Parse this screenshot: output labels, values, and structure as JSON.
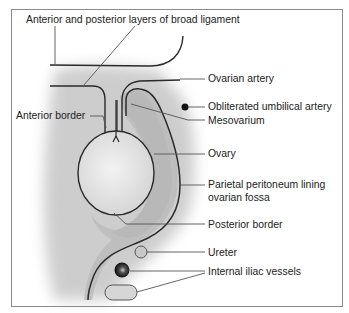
{
  "diagram": {
    "labels": {
      "broad_ligament": "Anterior and posterior layers of broad ligament",
      "ovarian_artery": "Ovarian artery",
      "obliterated_umbilical_artery": "Obliterated umbilical artery",
      "mesovarium": "Mesovarium",
      "anterior_border": "Anterior border",
      "ovary": "Ovary",
      "parietal_peritoneum_line1": "Parietal peritoneum lining",
      "parietal_peritoneum_line2": "ovarian fossa",
      "posterior_border": "Posterior border",
      "ureter": "Ureter",
      "internal_iliac_vessels": "Internal iliac vessels"
    },
    "colors": {
      "frame": "#8a8a8a",
      "outline": "#2a2a2a",
      "fossa_fill": "#bdbdbd",
      "shadow": "#9a9a9a",
      "leader": "#555555",
      "ureter_fill": "#c8c8c8",
      "vessel_fill": "#111111",
      "vein_fill": "#d6d6d6"
    }
  }
}
